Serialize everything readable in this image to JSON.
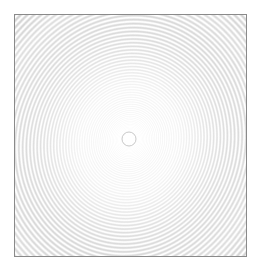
{
  "figure": {
    "title": "",
    "background_color": "#ffffff",
    "width": 261,
    "height": 273
  },
  "frame": {
    "border_color": "#8a8a8a",
    "border_width": 1,
    "fill_color": "#ffffff",
    "left": 14,
    "top": 14,
    "width": 233,
    "height": 243
  },
  "chart_data": {
    "type": "heatmap",
    "title": "",
    "subtitle": "",
    "xlabel": "",
    "ylabel": "",
    "pattern": "concentric-interference-rings",
    "grid": false,
    "legend": null,
    "axis_ticks_visible": false,
    "tick_labels": [],
    "center": {
      "x": 129,
      "y": 139
    },
    "center_normalized": {
      "x": 0.494,
      "y": 0.509
    },
    "inner_ring_radius_px": 7,
    "max_radius_px": 190,
    "ring_count": 150,
    "fringe_spacing_law": "radius proportional to sqrt(index) - fringes compress with increasing radius",
    "colors": {
      "background": "#ffffff",
      "fringe_light": "#ffffff",
      "fringe_dark": "#c9c9c9",
      "frame": "#8a8a8a",
      "darkest_value": "#b8b8b8",
      "lightest_value": "#ffffff"
    },
    "value_range": [
      0.0,
      1.0
    ],
    "contrast_falloff": "amplitude increases from near zero at the center to maximum near the outer corners",
    "noise": {
      "present": true,
      "type": "fine speckle / dithering",
      "amplitude": 0.04
    },
    "series": [
      {
        "name": "radial-intensity",
        "description": "Normalized fringe intensity sampled along a radius from the pattern center to the frame corner.",
        "x": [
          0,
          10,
          20,
          30,
          40,
          50,
          60,
          70,
          80,
          90,
          100,
          110,
          120,
          130,
          140,
          150,
          160,
          170,
          180,
          190
        ],
        "values": [
          1.0,
          0.99,
          0.97,
          0.96,
          0.95,
          0.94,
          0.93,
          0.93,
          0.92,
          0.91,
          0.91,
          0.9,
          0.89,
          0.89,
          0.88,
          0.88,
          0.87,
          0.87,
          0.86,
          0.86
        ]
      }
    ]
  }
}
